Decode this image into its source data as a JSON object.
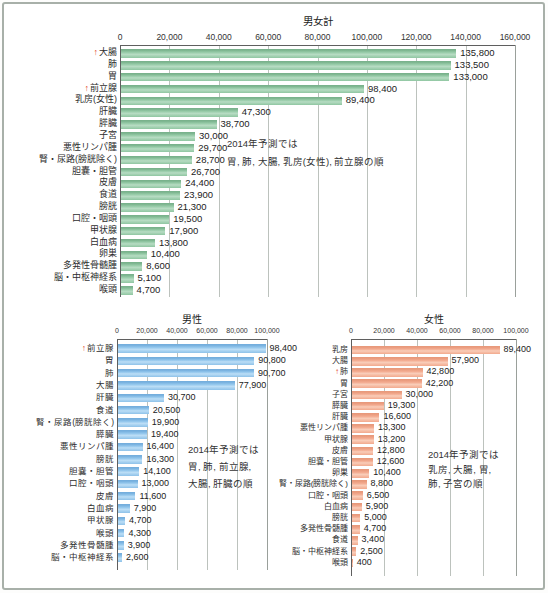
{
  "figure": {
    "border_color": "#a8b0a9",
    "background": "#ffffff"
  },
  "chart_data": [
    {
      "type": "bar",
      "orientation": "horizontal",
      "title": "男女計",
      "xlabel": "",
      "ylabel": "",
      "xlim": [
        0,
        160000
      ],
      "tick_step": 20000,
      "tick_labels": [
        "0",
        "20,000",
        "40,000",
        "60,000",
        "80,000",
        "100,000",
        "120,000",
        "140,000",
        "160,000"
      ],
      "grid": true,
      "bar_colors": {
        "dark": "#79b28c",
        "mid": "#97cba8",
        "light": "#b7dcc3",
        "base": "#8fc6a1"
      },
      "arrow_color": "#e04a2c",
      "categories": [
        "大腸",
        "肺",
        "胃",
        "前立腺",
        "乳房(女性)",
        "肝臓",
        "膵臓",
        "子宮",
        "悪性リンパ腫",
        "腎・尿路(膀胱除く)",
        "胆嚢・胆管",
        "皮膚",
        "食道",
        "膀胱",
        "口腔・咽頭",
        "甲状腺",
        "白血病",
        "卵巣",
        "多発性骨髄腫",
        "脳・中枢神経系",
        "喉頭"
      ],
      "values": [
        135800,
        133500,
        133000,
        98400,
        89400,
        47300,
        38700,
        30000,
        29700,
        28700,
        26700,
        24400,
        23900,
        21300,
        19500,
        17900,
        13800,
        10400,
        8600,
        5100,
        4700
      ],
      "arrow_categories": [
        "大腸",
        "前立腺"
      ],
      "annotation": {
        "lines": [
          "2014年予測では",
          "胃, 肺, 大腸, 乳房(女性), 前立腺の順"
        ]
      }
    },
    {
      "type": "bar",
      "orientation": "horizontal",
      "title": "男性",
      "xlabel": "",
      "ylabel": "",
      "xlim": [
        0,
        100000
      ],
      "tick_step": 20000,
      "tick_labels": [
        "0",
        "20,000",
        "40,000",
        "60,000",
        "80,000",
        "100,000"
      ],
      "grid": true,
      "bar_colors": {
        "dark": "#74aedd",
        "mid": "#92c6ec",
        "light": "#bcdef6",
        "base": "#8ec2e9"
      },
      "arrow_color": "#e04a2c",
      "categories": [
        "前立腺",
        "胃",
        "肺",
        "大腸",
        "肝臓",
        "食道",
        "腎・尿路(膀胱除く)",
        "膵臓",
        "悪性リンパ腫",
        "膀胱",
        "胆嚢・胆管",
        "口腔・咽頭",
        "皮膚",
        "白血病",
        "甲状腺",
        "喉頭",
        "多発性骨髄腫",
        "脳・中枢神経系"
      ],
      "values": [
        98400,
        90800,
        90700,
        77900,
        30700,
        20500,
        19900,
        19400,
        16400,
        16300,
        14100,
        13000,
        11600,
        7900,
        4700,
        4300,
        3900,
        2600
      ],
      "arrow_categories": [
        "前立腺"
      ],
      "annotation": {
        "lines": [
          "2014年予測では",
          "胃, 肺, 前立腺,",
          "大腸, 肝臓の順"
        ]
      }
    },
    {
      "type": "bar",
      "orientation": "horizontal",
      "title": "女性",
      "xlabel": "",
      "ylabel": "",
      "xlim": [
        0,
        100000
      ],
      "tick_step": 20000,
      "tick_labels": [
        "0",
        "20,000",
        "40,000",
        "60,000",
        "80,000",
        "100,000"
      ],
      "grid": true,
      "bar_colors": {
        "dark": "#e8997b",
        "mid": "#f3ab90",
        "light": "#f9cdb9",
        "base": "#f2a98d"
      },
      "arrow_color": "#e04a2c",
      "categories": [
        "乳房",
        "大腸",
        "肺",
        "胃",
        "子宮",
        "膵臓",
        "肝臓",
        "悪性リンパ腫",
        "甲状腺",
        "皮膚",
        "胆嚢・胆管",
        "卵巣",
        "腎・尿路(膀胱除く)",
        "口腔・咽頭",
        "白血病",
        "膀胱",
        "多発性骨髄腫",
        "食道",
        "脳・中枢神経系",
        "喉頭"
      ],
      "values": [
        89400,
        57900,
        42800,
        42200,
        30000,
        19300,
        16600,
        13300,
        13200,
        12800,
        12600,
        10400,
        8800,
        6500,
        5900,
        5000,
        4700,
        3400,
        2500,
        400
      ],
      "arrow_categories": [
        "肺"
      ],
      "annotation": {
        "lines": [
          "2014年予測では",
          "乳房, 大腸, 胃,",
          "肺, 子宮の順"
        ]
      }
    }
  ]
}
